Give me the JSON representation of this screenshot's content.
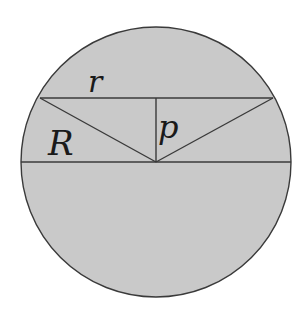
{
  "diagram": {
    "colors": {
      "background": "#ffffff",
      "circle_fill": "#c9c9c9",
      "stroke": "#3a3a3a",
      "label": "#1a1a1a"
    },
    "circle": {
      "cx": 156,
      "cy": 162,
      "r": 135
    },
    "diameter": {
      "x1": 21,
      "y1": 162,
      "x2": 291,
      "y2": 162
    },
    "chord": {
      "x1": 40,
      "y1": 98,
      "x2": 273,
      "y2": 98
    },
    "center": {
      "x": 156,
      "y": 162
    },
    "perpendicular": {
      "x1": 156,
      "y1": 98,
      "x2": 156,
      "y2": 162
    },
    "labels": {
      "r": "r",
      "R": "R",
      "p": "p"
    },
    "label_positions": {
      "r": {
        "x": 88,
        "y": 92,
        "size": 30
      },
      "R": {
        "x": 48,
        "y": 155,
        "size": 34
      },
      "p": {
        "x": 158,
        "y": 138,
        "size": 32
      }
    }
  }
}
